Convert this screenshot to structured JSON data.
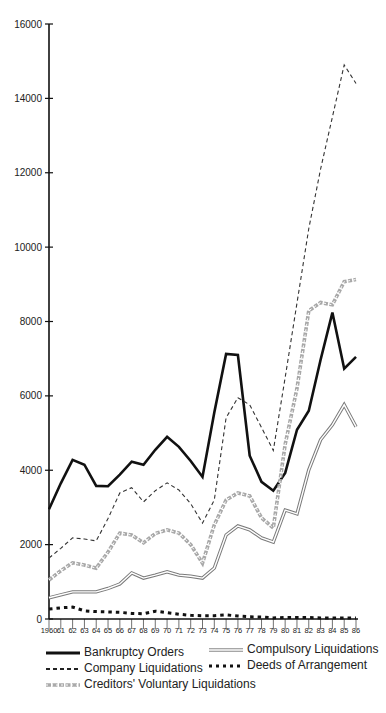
{
  "chart_data": {
    "type": "line",
    "title": "",
    "xlabel": "",
    "ylabel": "",
    "ylim": [
      0,
      16000
    ],
    "yticks": [
      0,
      2000,
      4000,
      6000,
      8000,
      10000,
      12000,
      14000,
      16000
    ],
    "ytick_labels": [
      "0",
      "2000",
      "4000",
      "6000",
      "8000",
      "10000",
      "12000",
      "14000",
      "16000"
    ],
    "x": [
      1960,
      1961,
      1962,
      1963,
      1964,
      1965,
      1966,
      1967,
      1968,
      1969,
      1970,
      1971,
      1972,
      1973,
      1974,
      1975,
      1976,
      1977,
      1978,
      1979,
      1980,
      1981,
      1982,
      1983,
      1984,
      1985,
      1986
    ],
    "xtick_labels": [
      "1960",
      "61",
      "62",
      "63",
      "64",
      "65",
      "66",
      "67",
      "68",
      "69",
      "70",
      "71",
      "72",
      "73",
      "74",
      "75",
      "76",
      "77",
      "78",
      "79",
      "80",
      "81",
      "82",
      "83",
      "84",
      "85",
      "86"
    ],
    "grid": false,
    "legend_position": "bottom",
    "series": [
      {
        "name": "Bankruptcy Orders",
        "style": "solid-thick",
        "color": "#111111",
        "values": [
          2950,
          3650,
          4280,
          4150,
          3580,
          3570,
          3880,
          4230,
          4150,
          4550,
          4900,
          4630,
          4250,
          3820,
          5550,
          7130,
          7100,
          4390,
          3690,
          3450,
          3930,
          5090,
          5600,
          6970,
          8240,
          6730,
          7050
        ]
      },
      {
        "name": "Company Liquidations",
        "style": "dashed",
        "color": "#444444",
        "values": [
          1640,
          1900,
          2180,
          2150,
          2100,
          2700,
          3390,
          3530,
          3150,
          3450,
          3660,
          3470,
          3100,
          2580,
          3200,
          5410,
          5950,
          5760,
          5150,
          4530,
          6500,
          8500,
          10500,
          12100,
          13500,
          14900,
          14400
        ]
      },
      {
        "name": "Creditors' Voluntary Liquidations",
        "style": "wavy-gray",
        "color": "#9a9a9a",
        "values": [
          1050,
          1300,
          1510,
          1450,
          1370,
          1800,
          2310,
          2260,
          2050,
          2300,
          2400,
          2310,
          2000,
          1500,
          2530,
          3200,
          3390,
          3310,
          2720,
          2450,
          4700,
          6200,
          8290,
          8510,
          8450,
          9070,
          9130
        ]
      },
      {
        "name": "Compulsory Liquidations",
        "style": "double-outline",
        "color": "#777777",
        "values": [
          570,
          650,
          730,
          730,
          730,
          820,
          940,
          1240,
          1100,
          1180,
          1270,
          1180,
          1150,
          1100,
          1370,
          2260,
          2500,
          2400,
          2180,
          2070,
          2930,
          2830,
          4010,
          4820,
          5220,
          5760,
          5170
        ]
      },
      {
        "name": "Deeds of Arrangement",
        "style": "dotted-thick",
        "color": "#111111",
        "values": [
          270,
          300,
          320,
          220,
          200,
          190,
          180,
          150,
          140,
          210,
          170,
          130,
          100,
          90,
          90,
          110,
          80,
          60,
          50,
          30,
          40,
          40,
          40,
          30,
          30,
          30,
          30
        ]
      }
    ]
  },
  "legend": {
    "items": [
      {
        "label": "Bankruptcy Orders"
      },
      {
        "label": "Compulsory Liquidations"
      },
      {
        "label": "Company Liquidations"
      },
      {
        "label": "Deeds of Arrangement"
      },
      {
        "label": "Creditors' Voluntary Liquidations"
      }
    ]
  }
}
